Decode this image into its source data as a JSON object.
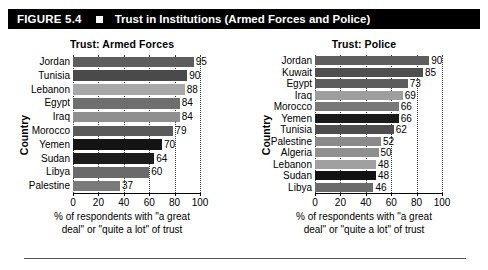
{
  "header": {
    "figure_number": "FIGURE 5.4",
    "marker_icon": "square-marker",
    "title": "Trust in Institutions (Armed Forces and Police)"
  },
  "axis_caption_line1": "% of respondents with \"a great",
  "axis_caption_line2": "deal\" or \"quite a lot\" of trust",
  "yaxis_title": "Country",
  "ticks": [
    "0",
    "20",
    "40",
    "60",
    "80",
    "100"
  ],
  "colors": {
    "header_bg": "#000000",
    "header_text": "#ffffff",
    "axis": "#000000",
    "gridline": "#3a3a3a"
  },
  "chart_data": [
    {
      "type": "bar",
      "title": "Trust: Armed Forces",
      "xlabel": "% of respondents with \"a great deal\" or \"quite a lot\" of trust",
      "ylabel": "Country",
      "xlim": [
        0,
        100
      ],
      "grid": true,
      "orientation": "horizontal",
      "categories": [
        "Jordan",
        "Tunisia",
        "Lebanon",
        "Egypt",
        "Iraq",
        "Morocco",
        "Yemen",
        "Sudan",
        "Libya",
        "Palestine"
      ],
      "values": [
        95,
        90,
        88,
        84,
        84,
        79,
        70,
        64,
        60,
        37
      ],
      "bar_colors": [
        "#5e5e5e",
        "#4a4a4a",
        "#a8a8a8",
        "#6e6e6e",
        "#8f8f8f",
        "#5a5a5a",
        "#141414",
        "#1c1c1c",
        "#6a6a6a",
        "#7a7a7a"
      ]
    },
    {
      "type": "bar",
      "title": "Trust: Police",
      "xlabel": "% of respondents with \"a great deal\" or \"quite a lot\" of trust",
      "ylabel": "Country",
      "xlim": [
        0,
        100
      ],
      "grid": true,
      "orientation": "horizontal",
      "categories": [
        "Jordan",
        "Kuwait",
        "Egypt",
        "Iraq",
        "Morocco",
        "Yemen",
        "Tunisia",
        "Palestine",
        "Algeria",
        "Lebanon",
        "Sudan",
        "Libya"
      ],
      "values": [
        90,
        85,
        73,
        69,
        66,
        66,
        62,
        52,
        50,
        48,
        48,
        46
      ],
      "bar_colors": [
        "#5e5e5e",
        "#4f4f4f",
        "#5c5c5c",
        "#9e9e9e",
        "#787878",
        "#1a1a1a",
        "#4d4d4d",
        "#8a8a8a",
        "#8f8f8f",
        "#a0a0a0",
        "#121212",
        "#6b6b6b"
      ]
    }
  ]
}
